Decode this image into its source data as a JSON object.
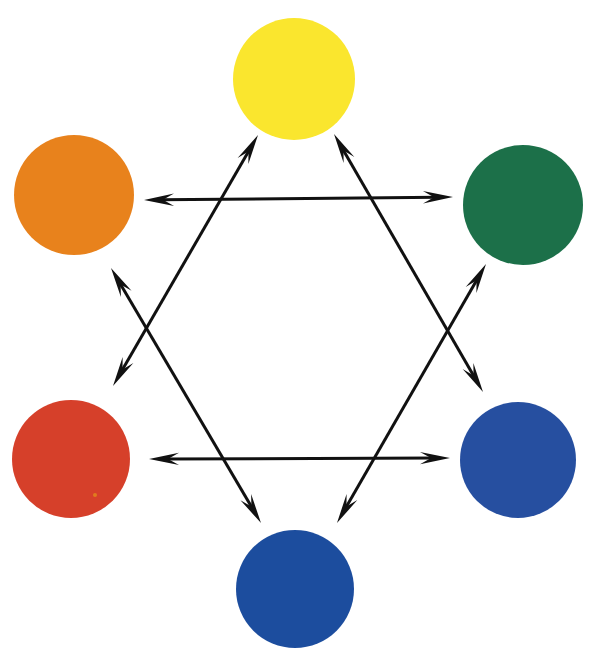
{
  "figure": {
    "background_color": "#ffffff",
    "width": 589,
    "height": 651
  },
  "chart_data": {
    "type": "diagram",
    "subtitle": "",
    "xlabel": "",
    "ylabel": "",
    "legend_position": "none",
    "grid": false,
    "layout": "hexagonal arrangement of six color discs joined by six double-headed arrows forming a hexagram (two overlapping triangles)",
    "nodes": [
      {
        "id": "yellow",
        "label": "Yellow",
        "color": "#FAE62D",
        "position": "top",
        "cx": 294,
        "cy": 79,
        "r": 61
      },
      {
        "id": "orange",
        "label": "Orange",
        "color": "#E8821E",
        "position": "upper-left",
        "cx": 74,
        "cy": 195,
        "r": 60
      },
      {
        "id": "green",
        "label": "Green",
        "color": "#1B7049",
        "position": "upper-right",
        "cx": 523,
        "cy": 205,
        "r": 60
      },
      {
        "id": "red",
        "label": "Red",
        "color": "#D6402B",
        "position": "lower-left",
        "cx": 71,
        "cy": 459,
        "r": 59
      },
      {
        "id": "blue-right",
        "label": "Blue",
        "color": "#2850A0",
        "position": "lower-right",
        "cx": 518,
        "cy": 460,
        "r": 58
      },
      {
        "id": "blue-bottom",
        "label": "Blue",
        "color": "#1F4E9E",
        "position": "bottom",
        "cx": 295,
        "cy": 589,
        "r": 59
      }
    ],
    "edges": [
      {
        "id": "orange-green",
        "from": "orange",
        "to": "green",
        "style": "double-headed arrow",
        "color": "#111111",
        "x1": 144,
        "y1": 200,
        "x2": 453,
        "y2": 197
      },
      {
        "id": "red-blue-right",
        "from": "red",
        "to": "blue-right",
        "style": "double-headed arrow",
        "color": "#111111",
        "x1": 149,
        "y1": 459,
        "x2": 450,
        "y2": 458
      },
      {
        "id": "red-yellow",
        "from": "red",
        "to": "yellow",
        "style": "double-headed arrow",
        "color": "#111111",
        "x1": 113,
        "y1": 386,
        "x2": 258,
        "y2": 135
      },
      {
        "id": "orange-bluebottom",
        "from": "orange",
        "to": "blue-bottom",
        "style": "double-headed arrow",
        "color": "#111111",
        "x1": 111,
        "y1": 268,
        "x2": 261,
        "y2": 523
      },
      {
        "id": "yellow-bluerightcross",
        "from": "yellow",
        "to": "blue-right",
        "style": "double-headed arrow",
        "color": "#111111",
        "x1": 334,
        "y1": 134,
        "x2": 483,
        "y2": 392
      },
      {
        "id": "green-bluebottom",
        "from": "green",
        "to": "blue-bottom",
        "style": "double-headed arrow",
        "color": "#111111",
        "x1": 486,
        "y1": 264,
        "x2": 337,
        "y2": 523
      }
    ],
    "marks": [
      {
        "id": "red-disc-speck",
        "description": "tiny orange speck on the red disc",
        "color": "#E07B1E",
        "cx": 95,
        "cy": 495,
        "r": 2
      }
    ],
    "complementary_pairs": [
      [
        "Orange",
        "Green"
      ],
      [
        "Red",
        "Blue"
      ],
      [
        "Yellow",
        "Blue"
      ]
    ]
  }
}
